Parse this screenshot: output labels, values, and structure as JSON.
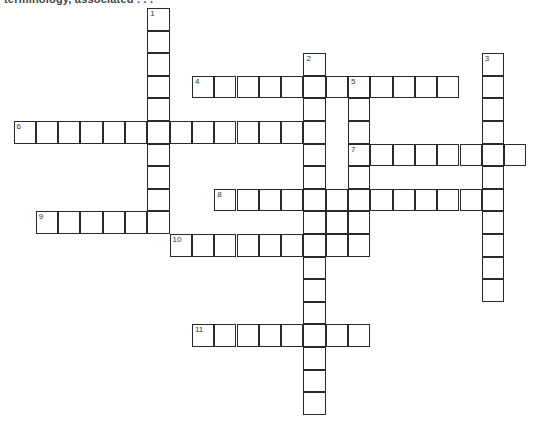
{
  "header": {
    "text": "terminology, associated . . ."
  },
  "grid": {
    "origin_x": 13.5,
    "origin_y": 8,
    "cell_w": 22.3,
    "cell_h": 22.6,
    "words": [
      {
        "number": "1",
        "direction": "down",
        "row": 0,
        "col": 6,
        "length": 10
      },
      {
        "number": "2",
        "direction": "down",
        "row": 2,
        "col": 13,
        "length": 16
      },
      {
        "number": "3",
        "direction": "down",
        "row": 2,
        "col": 21,
        "length": 11
      },
      {
        "number": "4",
        "direction": "across",
        "row": 3,
        "col": 8,
        "length": 12
      },
      {
        "number": "5",
        "direction": "down",
        "row": 3,
        "col": 15,
        "length": 8
      },
      {
        "number": "6",
        "direction": "across",
        "row": 5,
        "col": 0,
        "length": 14
      },
      {
        "number": "7",
        "direction": "across",
        "row": 6,
        "col": 15,
        "length": 8
      },
      {
        "number": "8",
        "direction": "across",
        "row": 8,
        "col": 9,
        "length": 13
      },
      {
        "number": "9",
        "direction": "across",
        "row": 9,
        "col": 1,
        "length": 6
      },
      {
        "number": "10",
        "direction": "across",
        "row": 10,
        "col": 7,
        "length": 9
      },
      {
        "number": "11",
        "direction": "across",
        "row": 14,
        "col": 8,
        "length": 8
      }
    ],
    "extra_cells": [
      {
        "row": 9,
        "col": 14
      }
    ]
  }
}
